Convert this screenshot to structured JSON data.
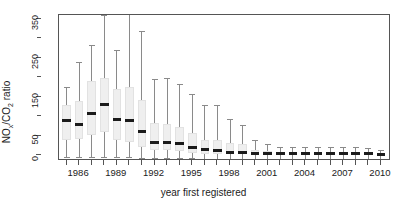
{
  "chart_data": {
    "type": "box",
    "title": "",
    "xlabel": "year first registered",
    "ylabel": "NOx/CO2 ratio",
    "ylabel_parts": {
      "pre": "NO",
      "sub1": "x",
      "mid": "/CO",
      "sub2": "2",
      "post": " ratio"
    },
    "ylim": [
      -15,
      360
    ],
    "xlim": [
      1984.4,
      2010.8
    ],
    "grid": false,
    "legend": null,
    "y_ticks_major": [
      0,
      50,
      150,
      250,
      350
    ],
    "y_ticks_minor": [
      100,
      200,
      300
    ],
    "y_tick_labels": [
      "0",
      "50",
      "150",
      "250",
      "350"
    ],
    "x_tick_years": [
      1985,
      1986,
      1987,
      1988,
      1989,
      1990,
      1991,
      1992,
      1993,
      1994,
      1995,
      1996,
      1997,
      1998,
      1999,
      2000,
      2001,
      2002,
      2003,
      2004,
      2005,
      2006,
      2007,
      2008,
      2009,
      2010
    ],
    "x_tick_labels": [
      "1986",
      "1989",
      "1992",
      "1995",
      "1998",
      "2001",
      "2004",
      "2007",
      "2010"
    ],
    "x_tick_label_years": [
      1986,
      1989,
      1992,
      1995,
      1998,
      2001,
      2004,
      2007,
      2010
    ],
    "colors": {
      "box_fill": "#efefef",
      "box_border": "#e2e2e2",
      "median": "#1b1b1b",
      "whisker": "#8a8a8a",
      "axis": "#555555",
      "text": "#1b1b1b",
      "background": "#ffffff"
    },
    "categories": [
      1985,
      1986,
      1987,
      1988,
      1989,
      1990,
      1991,
      1992,
      1993,
      1994,
      1995,
      1996,
      1997,
      1998,
      1999,
      2000,
      2001,
      2002,
      2003,
      2004,
      2005,
      2006,
      2007,
      2008,
      2009,
      2010
    ],
    "boxes": [
      {
        "year": 1985,
        "lower_whisker": -6,
        "q1": 38,
        "median": 88,
        "q3": 128,
        "upper_whisker": 175
      },
      {
        "year": 1986,
        "lower_whisker": -4,
        "q1": 42,
        "median": 78,
        "q3": 140,
        "upper_whisker": 238
      },
      {
        "year": 1987,
        "lower_whisker": -5,
        "q1": 52,
        "median": 108,
        "q3": 190,
        "upper_whisker": 282
      },
      {
        "year": 1988,
        "lower_whisker": -4,
        "q1": 60,
        "median": 130,
        "q3": 197,
        "upper_whisker": 360
      },
      {
        "year": 1989,
        "lower_whisker": -6,
        "q1": 40,
        "median": 92,
        "q3": 170,
        "upper_whisker": 270
      },
      {
        "year": 1990,
        "lower_whisker": -6,
        "q1": 35,
        "median": 88,
        "q3": 175,
        "upper_whisker": 362
      },
      {
        "year": 1991,
        "lower_whisker": -7,
        "q1": 20,
        "median": 62,
        "q3": 142,
        "upper_whisker": 320
      },
      {
        "year": 1992,
        "lower_whisker": -8,
        "q1": 12,
        "median": 32,
        "q3": 82,
        "upper_whisker": 195
      },
      {
        "year": 1993,
        "lower_whisker": -8,
        "q1": 12,
        "median": 32,
        "q3": 80,
        "upper_whisker": 198
      },
      {
        "year": 1994,
        "lower_whisker": -8,
        "q1": 10,
        "median": 30,
        "q3": 72,
        "upper_whisker": 182
      },
      {
        "year": 1995,
        "lower_whisker": -8,
        "q1": 6,
        "median": 20,
        "q3": 58,
        "upper_whisker": 158
      },
      {
        "year": 1996,
        "lower_whisker": -9,
        "q1": 4,
        "median": 14,
        "q3": 40,
        "upper_whisker": 128
      },
      {
        "year": 1997,
        "lower_whisker": -9,
        "q1": 3,
        "median": 12,
        "q3": 38,
        "upper_whisker": 128
      },
      {
        "year": 1998,
        "lower_whisker": -9,
        "q1": 2,
        "median": 8,
        "q3": 30,
        "upper_whisker": 92
      },
      {
        "year": 1999,
        "lower_whisker": -9,
        "q1": 2,
        "median": 7,
        "q3": 28,
        "upper_whisker": 78
      },
      {
        "year": 2000,
        "lower_whisker": -9,
        "q1": 1,
        "median": 5,
        "q3": 12,
        "upper_whisker": 38
      },
      {
        "year": 2001,
        "lower_whisker": -9,
        "q1": 1,
        "median": 4,
        "q3": 10,
        "upper_whisker": 28
      },
      {
        "year": 2002,
        "lower_whisker": -10,
        "q1": 1,
        "median": 3,
        "q3": 8,
        "upper_whisker": 22
      },
      {
        "year": 2003,
        "lower_whisker": -10,
        "q1": 1,
        "median": 3,
        "q3": 7,
        "upper_whisker": 20
      },
      {
        "year": 2004,
        "lower_whisker": -10,
        "q1": 1,
        "median": 3,
        "q3": 7,
        "upper_whisker": 20
      },
      {
        "year": 2005,
        "lower_whisker": -10,
        "q1": 1,
        "median": 3,
        "q3": 7,
        "upper_whisker": 20
      },
      {
        "year": 2006,
        "lower_whisker": -10,
        "q1": 1,
        "median": 3,
        "q3": 7,
        "upper_whisker": 20
      },
      {
        "year": 2007,
        "lower_whisker": -10,
        "q1": 1,
        "median": 3,
        "q3": 7,
        "upper_whisker": 20
      },
      {
        "year": 2008,
        "lower_whisker": -10,
        "q1": 1,
        "median": 3,
        "q3": 7,
        "upper_whisker": 20
      },
      {
        "year": 2009,
        "lower_whisker": -10,
        "q1": 1,
        "median": 3,
        "q3": 7,
        "upper_whisker": 18
      },
      {
        "year": 2010,
        "lower_whisker": -10,
        "q1": 0,
        "median": 2,
        "q3": 5,
        "upper_whisker": 14
      }
    ]
  }
}
